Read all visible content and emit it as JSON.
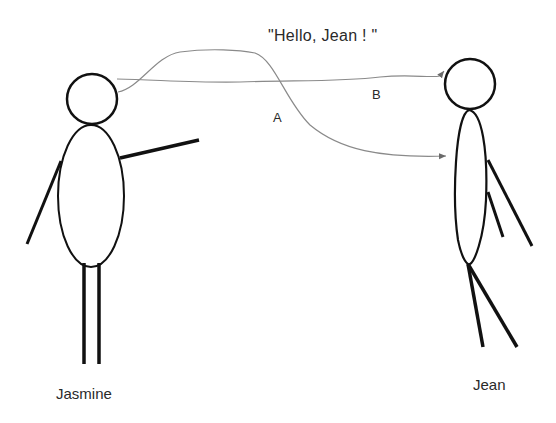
{
  "diagram": {
    "message": "\"Hello, Jean ! \"",
    "paths": [
      {
        "id": "A",
        "label": "A",
        "style": "curved, dips below then arrives at Jean's body"
      },
      {
        "id": "B",
        "label": "B",
        "style": "near-straight, arrives at Jean's head"
      }
    ],
    "people": [
      {
        "name": "Jasmine",
        "position": "left",
        "role": "sender"
      },
      {
        "name": "Jean",
        "position": "right",
        "role": "receiver"
      }
    ],
    "colors": {
      "figure_stroke": "#111111",
      "arrow_stroke": "#8a8a8a",
      "text": "#2a2a2a",
      "background": "#ffffff"
    }
  }
}
